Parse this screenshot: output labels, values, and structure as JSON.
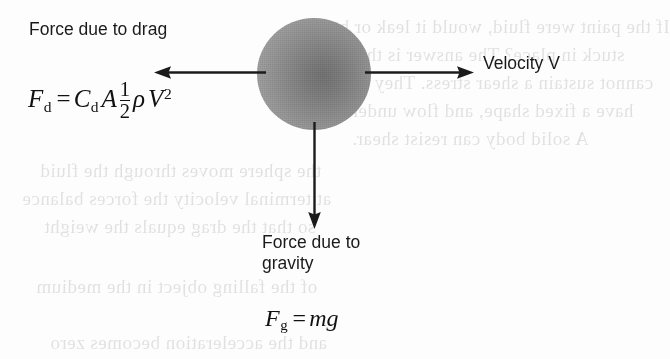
{
  "figure": {
    "name": "free-body-diagram-sphere-drag",
    "background_color": "#fdfdfd",
    "ink_color": "#1a1a1a",
    "sphere_color_center": "#6f6f6f",
    "sphere_color_edge": "#a6a6a6"
  },
  "labels": {
    "drag": "Force due to drag",
    "velocity": "Velocity V",
    "gravity": "Force due to\ngravity"
  },
  "equations": {
    "drag": {
      "lhs_symbol": "F",
      "lhs_subscript": "d",
      "equals": "=",
      "coefficient_symbol": "C",
      "coefficient_subscript": "d",
      "area_symbol": "A",
      "fraction_numerator": "1",
      "fraction_denominator": "2",
      "density_symbol": "ρ",
      "velocity_symbol": "V",
      "velocity_exponent": "2",
      "plain_text": "F_d = C_d A (1/2) ρ V²"
    },
    "gravity": {
      "lhs_symbol": "F",
      "lhs_subscript": "g",
      "equals": "=",
      "mass_symbol": "m",
      "gravity_symbol": "g",
      "plain_text": "F_g = mg"
    }
  },
  "arrows": [
    {
      "name": "drag-arrow",
      "direction": "left",
      "label": "Force due to drag"
    },
    {
      "name": "velocity-arrow",
      "direction": "right",
      "label": "Velocity V"
    },
    {
      "name": "gravity-arrow",
      "direction": "down",
      "label": "Force due to gravity"
    }
  ],
  "bleed_through": [
    {
      "text": "If the paint were fluid, would it leak or be",
      "x": 330,
      "y": 16
    },
    {
      "text": "stuck in place? The answer is that fluids",
      "x": 300,
      "y": 44
    },
    {
      "text": "cannot sustain a shear stress. They do not",
      "x": 318,
      "y": 72
    },
    {
      "text": "have a fixed shape, and flow under load.",
      "x": 306,
      "y": 100
    },
    {
      "text": "A solid body can resist shear.",
      "x": 352,
      "y": 128
    },
    {
      "text": "the sphere moves through the fluid",
      "x": 40,
      "y": 160
    },
    {
      "text": "at terminal velocity the forces balance",
      "x": 22,
      "y": 188
    },
    {
      "text": "so that the drag equals the weight",
      "x": 44,
      "y": 216
    },
    {
      "text": "of the falling object in the medium",
      "x": 36,
      "y": 276
    },
    {
      "text": "and the acceleration becomes zero",
      "x": 50,
      "y": 332
    }
  ]
}
